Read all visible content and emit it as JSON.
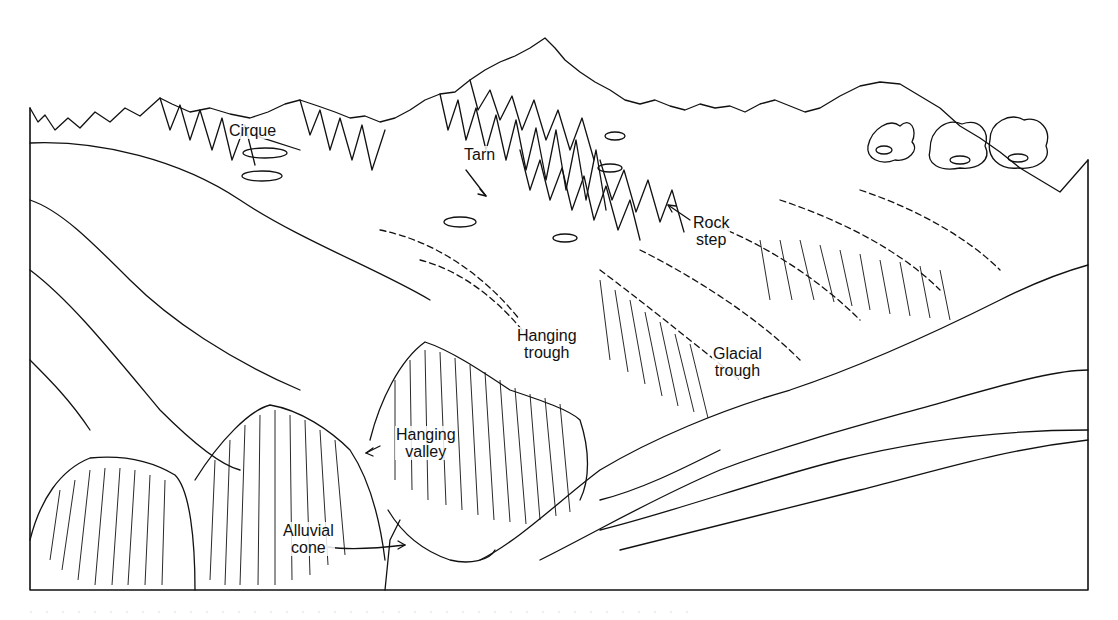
{
  "figure": {
    "colors": {
      "ink": "#111111",
      "paper": "#ffffff"
    },
    "labels": [
      {
        "id": "cirque",
        "lines": [
          "Cirque"
        ],
        "x": 228,
        "y": 122
      },
      {
        "id": "tarn",
        "lines": [
          "Tarn"
        ],
        "x": 463,
        "y": 146
      },
      {
        "id": "rock-step",
        "lines": [
          "Rock",
          "step"
        ],
        "x": 692,
        "y": 216
      },
      {
        "id": "hanging-trough",
        "lines": [
          "Hanging",
          "trough"
        ],
        "x": 520,
        "y": 330
      },
      {
        "id": "glacial-trough",
        "lines": [
          "Glacial",
          "trough"
        ],
        "x": 714,
        "y": 345
      },
      {
        "id": "hanging-valley",
        "lines": [
          "Hanging",
          "valley"
        ],
        "x": 398,
        "y": 426
      },
      {
        "id": "alluvial-cone",
        "lines": [
          "Alluvial",
          "cone"
        ],
        "x": 283,
        "y": 522
      }
    ]
  }
}
